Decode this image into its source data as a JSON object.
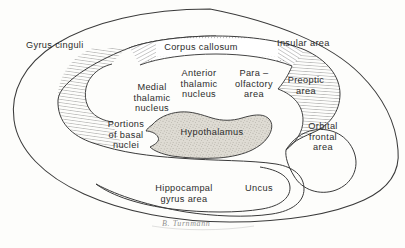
{
  "figure": {
    "background_color": "#fdfdfb",
    "ink_color": "#3a3a3a",
    "text_color": "#2b2b2b",
    "hypothalamus_fill": "#d9d6cf",
    "signature": "B. Turnmann"
  },
  "labels": {
    "gyrus_cinguli": "Gyrus  cinguli",
    "corpus_callosum": "Corpus  callosum",
    "insular_area": "Insular  area",
    "medial_thalamic_nucleus": "Medial\nthalamic\nnucleus",
    "anterior_thalamic_nucleus": "Anterior\nthalamic\nnucleus",
    "para_olfactory_area": "Para –\nolfactory\narea",
    "preoptic_area": "Preoptic\narea",
    "portions_of_basal_nuclei": "Portions\nof  basal\nnuclei",
    "hypothalamus": "Hypothalamus",
    "orbital_frontal_area": "Orbital\nfrontal\narea",
    "hippocampal_gyrus_area": "Hippocampal\ngyrus  area",
    "uncus": "Uncus"
  }
}
